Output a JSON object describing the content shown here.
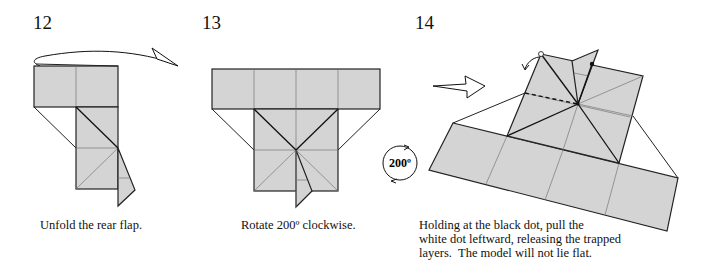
{
  "steps": [
    {
      "number": "12",
      "caption": "Unfold the rear flap."
    },
    {
      "number": "13",
      "caption": "Rotate 200º clockwise.",
      "rotation_symbol": {
        "label": "200º",
        "direction": "clockwise"
      }
    },
    {
      "number": "14",
      "caption_lines": [
        "Holding at the black dot, pull the",
        "white dot leftward, releasing the trapped",
        "layers.  The model will not lie flat."
      ],
      "markers": [
        "white-dot",
        "black-dot",
        "push-arrow",
        "pull-arrow"
      ]
    }
  ],
  "colors": {
    "paper": "#d4d4d4",
    "line": "#222222",
    "crease": "#777777",
    "background": "#ffffff"
  }
}
